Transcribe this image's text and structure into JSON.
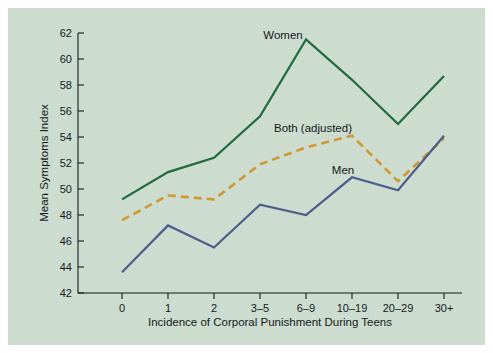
{
  "chart_data": {
    "type": "line",
    "title": "",
    "subtitle": "",
    "xlabel": "Incidence of Corporal Punishment During Teens",
    "ylabel": "Mean Symptoms Index",
    "categories": [
      "0",
      "1",
      "2",
      "3–5",
      "6–9",
      "10–19",
      "20–29",
      "30+"
    ],
    "ylim": [
      42,
      62
    ],
    "yticks": [
      "42",
      "44",
      "46",
      "48",
      "50",
      "52",
      "54",
      "56",
      "58",
      "60",
      "62"
    ],
    "ytick_values": [
      42,
      44,
      46,
      48,
      50,
      52,
      54,
      56,
      58,
      60,
      62
    ],
    "grid": false,
    "legend_position": "inline-annotations",
    "series": [
      {
        "name": "Women",
        "color": "#1d6b3f",
        "style": "solid",
        "values": [
          49.2,
          51.3,
          52.4,
          55.6,
          61.5,
          58.4,
          55.0,
          58.7
        ]
      },
      {
        "name": "Both (adjusted)",
        "color": "#d2982c",
        "style": "dashed",
        "values": [
          47.6,
          49.5,
          49.2,
          51.9,
          53.2,
          54.1,
          50.6,
          53.9
        ]
      },
      {
        "name": "Men",
        "color": "#4d5c8c",
        "style": "solid",
        "values": [
          43.6,
          47.2,
          45.5,
          48.8,
          48.0,
          50.9,
          49.9,
          54.1
        ]
      }
    ],
    "annotations": [
      {
        "text": "Women",
        "series": "Women",
        "x_px": 283,
        "y_px": 39
      },
      {
        "text": "Both (adjusted)",
        "series": "Both (adjusted)",
        "x_px": 313,
        "y_px": 132
      },
      {
        "text": "Men",
        "series": "Men",
        "x_px": 343,
        "y_px": 174
      }
    ]
  },
  "colors": {
    "background": "#ccdcce",
    "page": "#ffffff",
    "axis": "#15191c",
    "women": "#1d6b3f",
    "both": "#d2982c",
    "men": "#4d5c8c"
  }
}
